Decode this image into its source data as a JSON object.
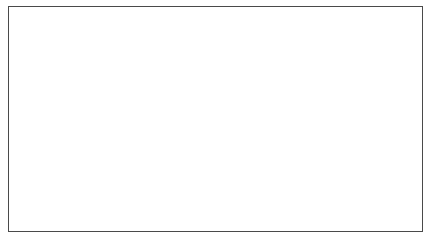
{
  "figure": {
    "kind": "3d-wireframe-render",
    "background_color": "#ffffff",
    "line_color": "#0d0d0d",
    "frame_color": "#4a4a4a",
    "frame": {
      "x": 8,
      "y": 6,
      "width": 415,
      "height": 226,
      "border_px": 1
    },
    "canvas": {
      "width": 436,
      "height": 243
    }
  },
  "chart_data": {
    "type": "line",
    "title": "",
    "subtitle": "",
    "xlabel": "",
    "ylabel": "",
    "legend": [],
    "grid": false,
    "annotations": [],
    "projection": {
      "type": "perspective",
      "view": "three-quarter-bow-from-above",
      "camera_azimuth_deg": 35,
      "camera_elevation_deg": 22,
      "focal_length": 900,
      "camera_distance": 26
    },
    "hull": {
      "length": 10.0,
      "max_half_beam": 1.62,
      "max_depth": 2.05,
      "bow_point_px": [
        383,
        40
      ],
      "stern_top_left_px": [
        49,
        76
      ],
      "keel_lowest_px": [
        150,
        220
      ],
      "n_stations": 23,
      "n_waterlines": 13,
      "station_u_values": [
        0.0,
        0.045,
        0.091,
        0.136,
        0.182,
        0.227,
        0.273,
        0.318,
        0.364,
        0.409,
        0.455,
        0.5,
        0.545,
        0.591,
        0.636,
        0.682,
        0.727,
        0.773,
        0.818,
        0.864,
        0.909,
        0.955,
        1.0
      ],
      "waterline_v_values": [
        0.0,
        0.083,
        0.167,
        0.25,
        0.333,
        0.417,
        0.5,
        0.583,
        0.667,
        0.75,
        0.833,
        0.917,
        1.0
      ],
      "sections": [
        {
          "u": 0.0,
          "halfbeam": 1.42,
          "depth": 1.62,
          "rise": 0.0,
          "fullness": 2.4
        },
        {
          "u": 0.09,
          "halfbeam": 1.55,
          "depth": 1.8,
          "rise": 0.04,
          "fullness": 2.25
        },
        {
          "u": 0.18,
          "halfbeam": 1.61,
          "depth": 1.94,
          "rise": 0.08,
          "fullness": 2.1
        },
        {
          "u": 0.27,
          "halfbeam": 1.62,
          "depth": 2.02,
          "rise": 0.12,
          "fullness": 2.0
        },
        {
          "u": 0.36,
          "halfbeam": 1.61,
          "depth": 2.05,
          "rise": 0.16,
          "fullness": 1.95
        },
        {
          "u": 0.45,
          "halfbeam": 1.56,
          "depth": 2.04,
          "rise": 0.22,
          "fullness": 1.9
        },
        {
          "u": 0.55,
          "halfbeam": 1.46,
          "depth": 1.99,
          "rise": 0.31,
          "fullness": 1.82
        },
        {
          "u": 0.64,
          "halfbeam": 1.31,
          "depth": 1.9,
          "rise": 0.43,
          "fullness": 1.72
        },
        {
          "u": 0.73,
          "halfbeam": 1.1,
          "depth": 1.76,
          "rise": 0.6,
          "fullness": 1.58
        },
        {
          "u": 0.82,
          "halfbeam": 0.83,
          "depth": 1.56,
          "rise": 0.82,
          "fullness": 1.42
        },
        {
          "u": 0.91,
          "halfbeam": 0.49,
          "depth": 1.28,
          "rise": 1.1,
          "fullness": 1.24
        },
        {
          "u": 1.0,
          "halfbeam": 0.02,
          "depth": 0.92,
          "rise": 1.42,
          "fullness": 1.08
        }
      ]
    }
  }
}
